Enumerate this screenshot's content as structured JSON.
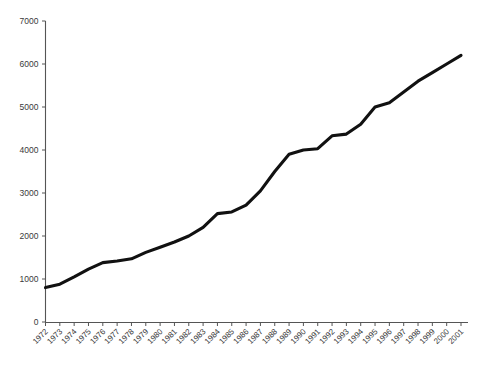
{
  "chart_data": {
    "type": "line",
    "title": "",
    "subtitle": "",
    "xlabel": "",
    "ylabel": "",
    "grid": false,
    "legend": "none",
    "xlim": [
      "1972",
      "2001"
    ],
    "ylim": [
      0,
      7000
    ],
    "ytick_labels": [
      "0",
      "1000",
      "2000",
      "3000",
      "4000",
      "5000",
      "6000",
      "7000"
    ],
    "ytick_values": [
      0,
      1000,
      2000,
      3000,
      4000,
      5000,
      6000,
      7000
    ],
    "categories": [
      "1972",
      "1973",
      "1974",
      "1975",
      "1976",
      "1977",
      "1978",
      "1979",
      "1980",
      "1981",
      "1982",
      "1983",
      "1984",
      "1985",
      "1986",
      "1987",
      "1988",
      "1989",
      "1990",
      "1991",
      "1992",
      "1993",
      "1994",
      "1995",
      "1996",
      "1997",
      "1998",
      "1999",
      "2000",
      "2001"
    ],
    "series": [
      {
        "name": "series-1",
        "color": "#111111",
        "values": [
          800,
          880,
          1050,
          1230,
          1380,
          1420,
          1470,
          1620,
          1740,
          1860,
          2000,
          2200,
          2520,
          2560,
          2720,
          3050,
          3500,
          3900,
          4000,
          4030,
          4330,
          4370,
          4600,
          5000,
          5100,
          5350,
          5600,
          5800,
          6000,
          6200
        ]
      }
    ]
  },
  "axes": {
    "y_axis_name": "y-axis",
    "x_axis_name": "x-axis"
  }
}
